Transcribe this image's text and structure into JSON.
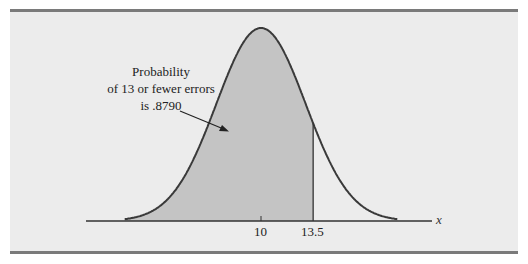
{
  "chart_data": {
    "type": "area",
    "title": "",
    "distribution": {
      "mean": 10,
      "std_dev": 3
    },
    "shaded_region": {
      "from": "-inf",
      "to": 13.5,
      "probability": 0.879
    },
    "xlabel": "x",
    "ylabel": "",
    "x_ticks": [
      {
        "value": 10,
        "label": "10"
      },
      {
        "value": 13.5,
        "label": "13.5"
      }
    ],
    "annotation": {
      "lines": [
        "Probability",
        "of 13 or fewer errors",
        "is .8790"
      ],
      "arrow_target": "shaded-area"
    },
    "grid": false,
    "legend": null,
    "colors": {
      "shaded": "#c4c4c4",
      "curve": "#3a3a3a",
      "background": "#ececec",
      "frame": "#7a7a7a"
    }
  },
  "annotation": {
    "line1": "Probability",
    "line2": "of 13 or fewer errors",
    "line3": "is .8790"
  },
  "axis": {
    "xlabel": "x",
    "tick_mean": "10",
    "tick_cut": "13.5"
  }
}
